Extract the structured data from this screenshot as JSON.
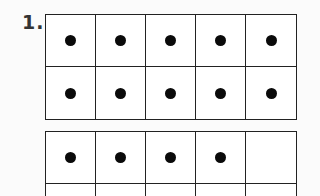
{
  "problem": {
    "number_label": "1."
  },
  "ten_frames": [
    {
      "rows": 2,
      "cols": 5,
      "filled": [
        1,
        1,
        1,
        1,
        1,
        1,
        1,
        1,
        1,
        1
      ],
      "dot_count": 10
    },
    {
      "rows": 2,
      "cols": 5,
      "filled": [
        1,
        1,
        1,
        1,
        0,
        0,
        0,
        0,
        0,
        0
      ],
      "dot_count": 4
    }
  ],
  "colors": {
    "grid_line": "#222222",
    "dot": "#0a0a0a",
    "background": "#ffffff"
  }
}
